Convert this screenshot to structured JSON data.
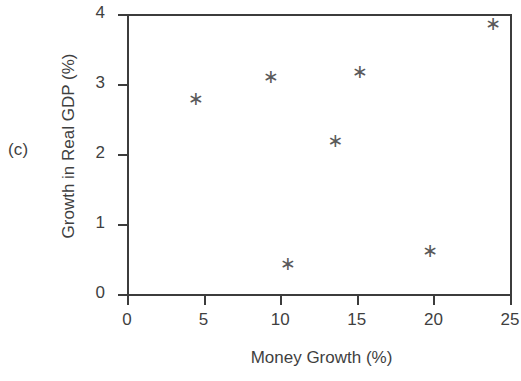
{
  "panel": {
    "label": "(c)"
  },
  "chart_data": {
    "type": "scatter",
    "title": "",
    "xlabel": "Money Growth (%)",
    "ylabel": "Growth in Real GDP (%)",
    "xlim": [
      0,
      25
    ],
    "ylim": [
      0,
      4
    ],
    "xticks": [
      0,
      5,
      10,
      15,
      20,
      25
    ],
    "yticks": [
      0,
      1,
      2,
      3,
      4
    ],
    "xtick_labels": [
      "0",
      "5",
      "10",
      "15",
      "20",
      "25"
    ],
    "ytick_labels": [
      "0",
      "1",
      "2",
      "3",
      "4"
    ],
    "grid": false,
    "legend": false,
    "marker": "*",
    "marker_glyph": "∗",
    "marker_color": "#5a5a5a",
    "axis_color": "#3c3c3c",
    "points": [
      {
        "x": 4.5,
        "y": 2.8
      },
      {
        "x": 9.4,
        "y": 3.12
      },
      {
        "x": 10.5,
        "y": 0.45
      },
      {
        "x": 13.6,
        "y": 2.2
      },
      {
        "x": 15.2,
        "y": 3.19
      },
      {
        "x": 19.8,
        "y": 0.63
      },
      {
        "x": 23.9,
        "y": 3.87
      }
    ]
  }
}
